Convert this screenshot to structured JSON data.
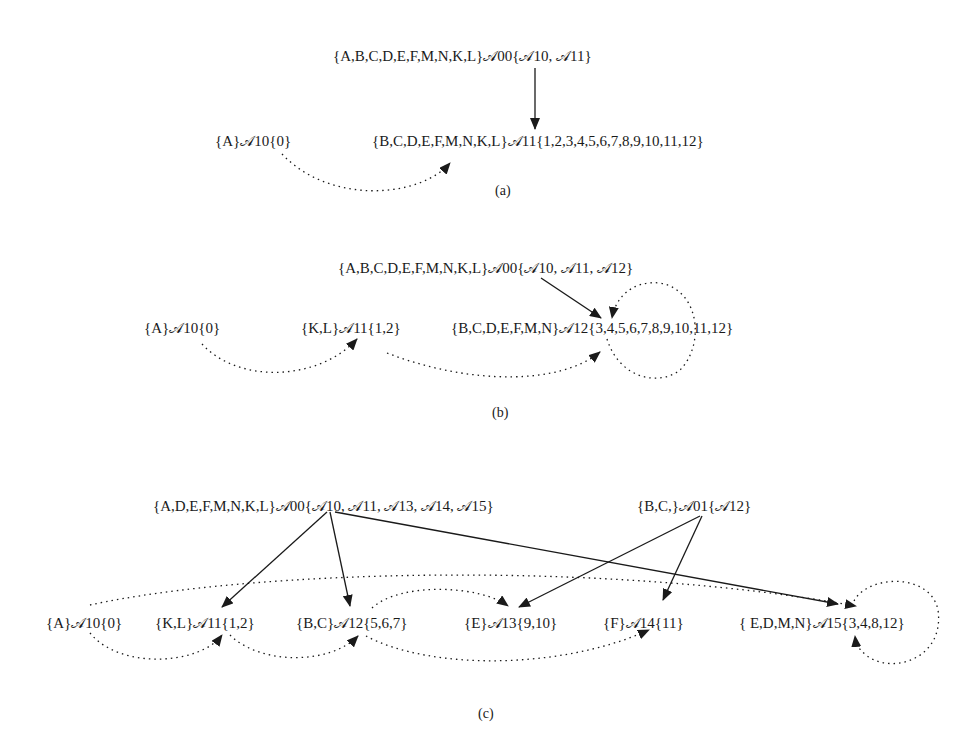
{
  "panels": [
    {
      "id": "a",
      "caption": "(a)",
      "nodes": {
        "root": "{A,B,C,D,E,F,M,N,K,L}𝒜00{𝒜10, 𝒜11}",
        "a10": "{A}𝒜10{0}",
        "a11": "{B,C,D,E,F,M,N,K,L}𝒜11{1,2,3,4,5,6,7,8,9,10,11,12}"
      },
      "edges": [
        {
          "from": "A00",
          "to": "A11",
          "style": "solid"
        },
        {
          "from": "A10",
          "to": "A11",
          "style": "dotted"
        },
        {
          "from": "A11",
          "to": "A11",
          "style": "dotted-loop"
        }
      ]
    },
    {
      "id": "b",
      "caption": "(b)",
      "nodes": {
        "root": "{A,B,C,D,E,F,M,N,K,L}𝒜00{𝒜10, 𝒜11, 𝒜12}",
        "a10": "{A}𝒜10{0}",
        "a11": "{K,L}𝒜11{1,2}",
        "a12": "{B,C,D,E,F,M,N}𝒜12{3,4,5,6,7,8,9,10,11,12}"
      },
      "edges": [
        {
          "from": "A00",
          "to": "A12",
          "style": "solid"
        },
        {
          "from": "A10",
          "to": "A11",
          "style": "dotted"
        },
        {
          "from": "A11",
          "to": "A12",
          "style": "dotted"
        },
        {
          "from": "A12",
          "to": "A12",
          "style": "dotted-loop"
        }
      ]
    },
    {
      "id": "c",
      "caption": "(c)",
      "nodes": {
        "root0": "{A,D,E,F,M,N,K,L}𝒜00{𝒜10, 𝒜11, 𝒜13, 𝒜14, 𝒜15}",
        "root1": "{B,C,}𝒜01{𝒜12}",
        "a10": "{A}𝒜10{0}",
        "a11": "{K,L}𝒜11{1,2}",
        "a12": "{B,C}𝒜12{5,6,7}",
        "a13": "{E}𝒜13{9,10}",
        "a14": "{F}𝒜14{11}",
        "a15": "{ E,D,M,N}𝒜15{3,4,8,12}"
      },
      "edges": [
        {
          "from": "A00",
          "to": "A11",
          "style": "solid"
        },
        {
          "from": "A00",
          "to": "A12",
          "style": "solid"
        },
        {
          "from": "A00",
          "to": "A15",
          "style": "solid"
        },
        {
          "from": "A01",
          "to": "A13",
          "style": "solid"
        },
        {
          "from": "A01",
          "to": "A14",
          "style": "solid"
        },
        {
          "from": "A10",
          "to": "A11",
          "style": "dotted"
        },
        {
          "from": "A10",
          "to": "A15",
          "style": "dotted"
        },
        {
          "from": "A11",
          "to": "A12",
          "style": "dotted"
        },
        {
          "from": "A12",
          "to": "A13",
          "style": "dotted"
        },
        {
          "from": "A12",
          "to": "A14",
          "style": "dotted"
        },
        {
          "from": "A15",
          "to": "A15",
          "style": "dotted-loop"
        }
      ]
    }
  ],
  "colors": {
    "ink": "#1a1a1a",
    "background": "#ffffff"
  }
}
